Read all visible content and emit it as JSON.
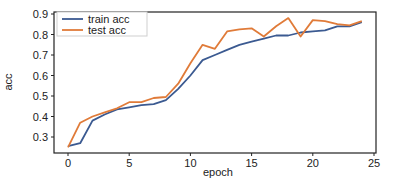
{
  "chart_data": {
    "type": "line",
    "title": "",
    "xlabel": "epoch",
    "ylabel": "acc",
    "xlim": [
      -1.2,
      25.1
    ],
    "ylim": [
      0.22,
      0.91
    ],
    "xticks": [
      0,
      5,
      10,
      15,
      20,
      25
    ],
    "yticks": [
      0.3,
      0.4,
      0.5,
      0.6,
      0.7,
      0.8,
      0.9
    ],
    "grid": false,
    "legend_position": "upper left",
    "x": [
      0,
      1,
      2,
      3,
      4,
      5,
      6,
      7,
      8,
      9,
      10,
      11,
      12,
      13,
      14,
      15,
      16,
      17,
      18,
      19,
      20,
      21,
      22,
      23,
      24
    ],
    "series": [
      {
        "name": "train acc",
        "color": "#3b5a91",
        "values": [
          0.255,
          0.27,
          0.38,
          0.41,
          0.435,
          0.445,
          0.455,
          0.46,
          0.48,
          0.535,
          0.6,
          0.675,
          0.7,
          0.725,
          0.75,
          0.765,
          0.78,
          0.795,
          0.795,
          0.81,
          0.815,
          0.82,
          0.84,
          0.84,
          0.86
        ]
      },
      {
        "name": "test acc",
        "color": "#e07b39",
        "values": [
          0.25,
          0.37,
          0.4,
          0.42,
          0.44,
          0.47,
          0.47,
          0.49,
          0.495,
          0.56,
          0.66,
          0.75,
          0.73,
          0.815,
          0.825,
          0.83,
          0.79,
          0.84,
          0.88,
          0.79,
          0.87,
          0.865,
          0.85,
          0.845,
          0.865
        ]
      }
    ]
  }
}
